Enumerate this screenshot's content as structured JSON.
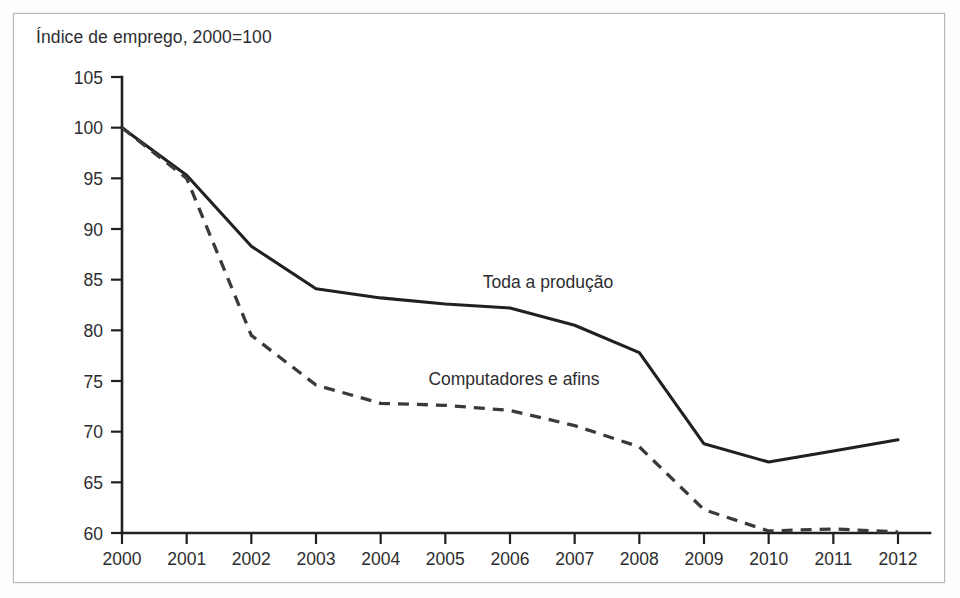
{
  "figure": {
    "title": "Índice de emprego, 2000=100",
    "frame_color": "#b9b9ba",
    "background": "#ffffff",
    "ink_color": "#231f20"
  },
  "chart_data": {
    "type": "line",
    "title": "Índice de emprego, 2000=100",
    "xlabel": "",
    "ylabel": "Índice de emprego, 2000=100",
    "x": [
      2000,
      2001,
      2002,
      2003,
      2004,
      2005,
      2006,
      2007,
      2008,
      2009,
      2010,
      2011,
      2012
    ],
    "categories": [
      "2000",
      "2001",
      "2002",
      "2003",
      "2004",
      "2005",
      "2006",
      "2007",
      "2008",
      "2009",
      "2010",
      "2011",
      "2012"
    ],
    "xlim": [
      2000,
      2012
    ],
    "ylim": [
      60,
      105
    ],
    "yticks": [
      60,
      65,
      70,
      75,
      80,
      85,
      90,
      95,
      100,
      105
    ],
    "ytick_labels": [
      "60",
      "65",
      "70",
      "75",
      "80",
      "85",
      "90",
      "95",
      "100",
      "105"
    ],
    "grid": false,
    "legend_position": "inline-annotation",
    "series": [
      {
        "name": "Toda a produção",
        "style": "solid",
        "color": "#231f20",
        "annotation": "Toda a produção",
        "values": [
          100.0,
          95.3,
          88.3,
          84.1,
          83.2,
          82.6,
          82.2,
          80.5,
          77.8,
          68.8,
          67.0,
          68.1,
          69.2
        ]
      },
      {
        "name": "Computadores e afins",
        "style": "dashed",
        "color": "#3a3a3c",
        "annotation": "Computadores e afins",
        "values": [
          100.0,
          95.0,
          79.5,
          74.6,
          72.8,
          72.6,
          72.1,
          70.6,
          68.5,
          62.3,
          60.2,
          60.4,
          60.1
        ]
      }
    ]
  }
}
